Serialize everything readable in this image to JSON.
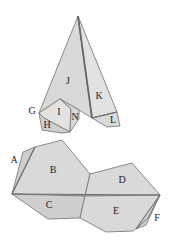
{
  "diagram": {
    "upper_figure": {
      "labels": [
        {
          "id": "J",
          "text": "J",
          "x": 68,
          "y": 82
        },
        {
          "id": "K",
          "text": "K",
          "x": 99,
          "y": 97
        },
        {
          "id": "G",
          "text": "G",
          "x": 32,
          "y": 112
        },
        {
          "id": "I",
          "text": "I",
          "x": 59,
          "y": 113
        },
        {
          "id": "N",
          "text": "N",
          "x": 75,
          "y": 118
        },
        {
          "id": "H",
          "text": "H",
          "x": 47,
          "y": 126
        },
        {
          "id": "L",
          "text": "L",
          "x": 113,
          "y": 121
        }
      ]
    },
    "lower_figure": {
      "labels": [
        {
          "id": "A",
          "text": "A",
          "x": 14,
          "y": 161
        },
        {
          "id": "B",
          "text": "B",
          "x": 53,
          "y": 171
        },
        {
          "id": "C",
          "text": "C",
          "x": 49,
          "y": 206
        },
        {
          "id": "D",
          "text": "D",
          "x": 122,
          "y": 181
        },
        {
          "id": "E",
          "text": "E",
          "x": 116,
          "y": 212
        },
        {
          "id": "F",
          "text": "F",
          "x": 157,
          "y": 219
        }
      ]
    },
    "colors": {
      "face_fill": "#d9d9d9",
      "edge": "#7d7d7d",
      "label": "#222222",
      "background": "#ffffff"
    }
  }
}
